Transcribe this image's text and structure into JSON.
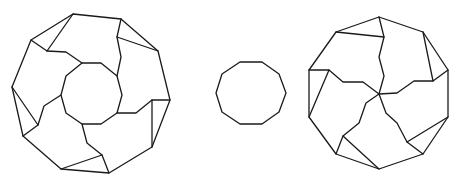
{
  "diagram": {
    "stroke_color": "#1a1a1a",
    "background": "#ffffff",
    "stroke_width": 1.3,
    "figures": [
      {
        "id": "left-ring-dissection",
        "description": "Regular decagon with central decagonal hole, divided into 5 congruent ring pieces and 5 triangles",
        "outer_decagon": [
          [
            73,
            14
          ],
          [
            121,
            19
          ],
          [
            158,
            51
          ],
          [
            170,
            100
          ],
          [
            152,
            147
          ],
          [
            109,
            173
          ],
          [
            61,
            169
          ],
          [
            23,
            136
          ],
          [
            12,
            87
          ],
          [
            31,
            40
          ]
        ],
        "inner_decagon": [
          [
            82,
            63
          ],
          [
            101,
            63
          ],
          [
            117,
            76
          ],
          [
            122,
            95
          ],
          [
            117,
            113
          ],
          [
            101,
            124
          ],
          [
            82,
            124
          ],
          [
            66,
            113
          ],
          [
            61,
            95
          ],
          [
            66,
            76
          ]
        ],
        "cut_paths": [
          [
            [
              82,
              63
            ],
            [
              66,
              52
            ],
            [
              47,
              51
            ],
            [
              31,
              40
            ]
          ],
          [
            [
              117,
              76
            ],
            [
              121,
              57
            ],
            [
              117,
              37
            ],
            [
              121,
              19
            ]
          ],
          [
            [
              117,
              113
            ],
            [
              136,
              113
            ],
            [
              152,
              100
            ],
            [
              170,
              100
            ]
          ],
          [
            [
              82,
              124
            ],
            [
              87,
              143
            ],
            [
              102,
              155
            ],
            [
              109,
              173
            ]
          ],
          [
            [
              61,
              95
            ],
            [
              44,
              106
            ],
            [
              38,
              125
            ],
            [
              23,
              136
            ]
          ]
        ],
        "triangle_edges": [
          [
            [
              73,
              14
            ],
            [
              47,
              51
            ]
          ],
          [
            [
              117,
              37
            ],
            [
              158,
              51
            ]
          ],
          [
            [
              152,
              100
            ],
            [
              152,
              147
            ]
          ],
          [
            [
              61,
              169
            ],
            [
              102,
              155
            ]
          ],
          [
            [
              12,
              87
            ],
            [
              38,
              125
            ]
          ]
        ]
      },
      {
        "id": "center-small-decagon",
        "description": "Small regular decagon",
        "outer_decagon": [
          [
            240,
            62
          ],
          [
            262,
            62
          ],
          [
            279,
            74
          ],
          [
            286,
            93
          ],
          [
            279,
            112
          ],
          [
            262,
            124
          ],
          [
            240,
            124
          ],
          [
            222,
            112
          ],
          [
            216,
            93
          ],
          [
            222,
            74
          ]
        ]
      },
      {
        "id": "right-pinwheel-dissection",
        "description": "Regular decagon divided into 5 pinwheel pieces meeting at center plus 5 triangles",
        "outer_decagon": [
          [
            379,
            17
          ],
          [
            423,
            32
          ],
          [
            448,
            70
          ],
          [
            448,
            117
          ],
          [
            423,
            154
          ],
          [
            379,
            169
          ],
          [
            336,
            154
          ],
          [
            309,
            117
          ],
          [
            309,
            70
          ],
          [
            336,
            32
          ]
        ],
        "center": [
          379,
          94
        ],
        "cut_paths": [
          [
            [
              379,
              94
            ],
            [
              384,
              76
            ],
            [
              379,
              57
            ],
            [
              384,
              37
            ],
            [
              379,
              17
            ]
          ],
          [
            [
              379,
              94
            ],
            [
              397,
              93
            ],
            [
              414,
              81
            ],
            [
              433,
              81
            ],
            [
              448,
              70
            ]
          ],
          [
            [
              379,
              94
            ],
            [
              386,
              113
            ],
            [
              397,
              123
            ],
            [
              407,
              142
            ],
            [
              423,
              154
            ]
          ],
          [
            [
              379,
              94
            ],
            [
              366,
              103
            ],
            [
              359,
              123
            ],
            [
              343,
              136
            ],
            [
              336,
              154
            ]
          ],
          [
            [
              379,
              94
            ],
            [
              363,
              82
            ],
            [
              343,
              82
            ],
            [
              329,
              70
            ],
            [
              309,
              70
            ]
          ]
        ],
        "triangle_edges": [
          [
            [
              336,
              32
            ],
            [
              384,
              37
            ]
          ],
          [
            [
              423,
              32
            ],
            [
              433,
              81
            ]
          ],
          [
            [
              448,
              117
            ],
            [
              407,
              142
            ]
          ],
          [
            [
              379,
              169
            ],
            [
              343,
              136
            ]
          ],
          [
            [
              309,
              117
            ],
            [
              329,
              70
            ]
          ]
        ]
      }
    ]
  }
}
